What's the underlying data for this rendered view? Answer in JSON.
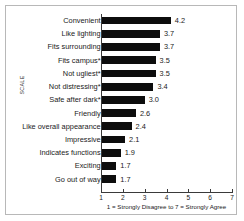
{
  "chart_data": {
    "type": "bar",
    "orientation": "horizontal",
    "title": "",
    "xlabel": "1 = Strongly Disagree to 7 = Strongly Agree",
    "ylabel": "SCALE",
    "xlim": [
      1,
      7
    ],
    "xticks": [
      1,
      2,
      3,
      4,
      5,
      6,
      7
    ],
    "xtick_labels": [
      "1",
      "2",
      "3",
      "4",
      "5",
      "6",
      "7"
    ],
    "grid": false,
    "legend": null,
    "bar_color": "#0d0d0d",
    "categories": [
      "Convenient",
      "Like lighting",
      "Fits surrounding",
      "Fits campus*",
      "Not ugliest*",
      "Not distressing*",
      "Safe after dark*",
      "Friendly",
      "Like overall appearance",
      "Impressive",
      "Indicates functions",
      "Exciting",
      "Go out of way"
    ],
    "values": [
      4.2,
      3.7,
      3.7,
      3.5,
      3.5,
      3.4,
      3.0,
      2.6,
      2.4,
      2.1,
      1.9,
      1.7,
      1.7
    ],
    "value_labels": [
      "4.2",
      "3.7",
      "3.7",
      "3.5",
      "3.5",
      "3.4",
      "3.0",
      "2.6",
      "2.4",
      "2.1",
      "1.9",
      "1.7",
      "1.7"
    ]
  }
}
